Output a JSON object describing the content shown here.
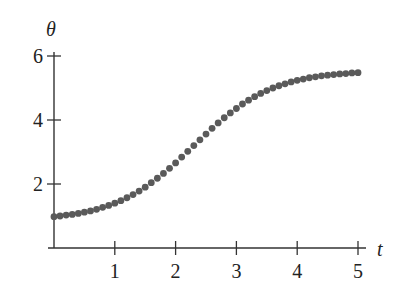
{
  "chart_data": {
    "type": "scatter",
    "title": "",
    "xlabel": "t",
    "ylabel": "θ",
    "xlim": [
      0,
      5
    ],
    "ylim": [
      0,
      6
    ],
    "x_ticks": [
      1,
      2,
      3,
      4,
      5
    ],
    "y_ticks": [
      2,
      4,
      6
    ],
    "grid": false,
    "legend": null,
    "marker_color": "#5a5a5a",
    "axis_color": "#333333",
    "series": [
      {
        "name": "θ(t)",
        "x": [
          0.0,
          0.1,
          0.2,
          0.3,
          0.4,
          0.5,
          0.6,
          0.7,
          0.8,
          0.9,
          1.0,
          1.1,
          1.2,
          1.3,
          1.4,
          1.5,
          1.6,
          1.7,
          1.8,
          1.9,
          2.0,
          2.1,
          2.2,
          2.3,
          2.4,
          2.5,
          2.6,
          2.7,
          2.8,
          2.9,
          3.0,
          3.1,
          3.2,
          3.3,
          3.4,
          3.5,
          3.6,
          3.7,
          3.8,
          3.9,
          4.0,
          4.1,
          4.2,
          4.3,
          4.4,
          4.5,
          4.6,
          4.7,
          4.8,
          4.9,
          5.0
        ],
        "values": [
          0.98,
          1.0,
          1.03,
          1.05,
          1.08,
          1.12,
          1.16,
          1.21,
          1.27,
          1.33,
          1.4,
          1.48,
          1.57,
          1.67,
          1.78,
          1.9,
          2.04,
          2.18,
          2.33,
          2.49,
          2.66,
          2.84,
          3.02,
          3.2,
          3.38,
          3.56,
          3.74,
          3.91,
          4.07,
          4.22,
          4.36,
          4.5,
          4.62,
          4.73,
          4.83,
          4.92,
          5.0,
          5.07,
          5.13,
          5.19,
          5.24,
          5.28,
          5.32,
          5.35,
          5.38,
          5.4,
          5.42,
          5.44,
          5.45,
          5.47,
          5.48
        ]
      }
    ]
  }
}
